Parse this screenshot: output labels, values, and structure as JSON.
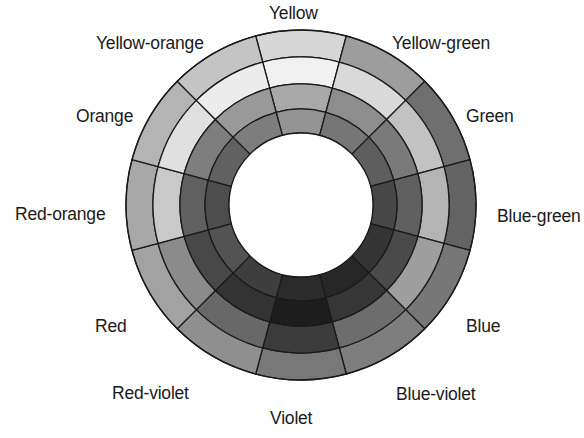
{
  "diagram": {
    "type": "color-wheel",
    "rendering": "grayscale",
    "sector_count": 12,
    "ring_count": 4,
    "geometry": {
      "center_x": 301,
      "center_y": 205,
      "outer_radius": 175,
      "ring_radii": [
        175,
        148,
        121,
        96,
        72
      ],
      "hole_radius": 72,
      "sector_degrees": 30,
      "stroke_color": "#1a1a1a",
      "stroke_width": 1.3,
      "background": "#ffffff"
    },
    "ring_names": [
      "outer-ring",
      "second-ring",
      "third-ring",
      "inner-ring"
    ],
    "hues": [
      {
        "name": "Yellow",
        "angle": 0,
        "label_x": 269,
        "label_y": 5,
        "rings": [
          "#d6d6d6",
          "#f1f1f1",
          "#a9a9a9",
          "#949494"
        ]
      },
      {
        "name": "Yellow-green",
        "angle": 30,
        "label_x": 392,
        "label_y": 35,
        "rings": [
          "#9d9d9d",
          "#d9d9d9",
          "#8d8d8d",
          "#767676"
        ]
      },
      {
        "name": "Green",
        "angle": 60,
        "label_x": 466,
        "label_y": 108,
        "rings": [
          "#6f6f6f",
          "#c2c2c2",
          "#7a7a7a",
          "#5e5e5e"
        ]
      },
      {
        "name": "Blue-green",
        "angle": 90,
        "label_x": 497,
        "label_y": 208,
        "rings": [
          "#636363",
          "#b4b4b4",
          "#5f5f5f",
          "#474747"
        ]
      },
      {
        "name": "Blue",
        "angle": 120,
        "label_x": 466,
        "label_y": 318,
        "rings": [
          "#777777",
          "#9e9e9e",
          "#4a4a4a",
          "#343434"
        ]
      },
      {
        "name": "Blue-violet",
        "angle": 150,
        "label_x": 396,
        "label_y": 386,
        "rings": [
          "#7e7e7e",
          "#6d6d6d",
          "#363636",
          "#272727"
        ]
      },
      {
        "name": "Violet",
        "angle": 180,
        "label_x": 270,
        "label_y": 410,
        "rings": [
          "#787878",
          "#3b3b3b",
          "#1d1d1d",
          "#2b2b2b"
        ]
      },
      {
        "name": "Red-violet",
        "angle": 210,
        "label_x": 112,
        "label_y": 385,
        "rings": [
          "#8f8f8f",
          "#686868",
          "#333333",
          "#3e3e3e"
        ]
      },
      {
        "name": "Red",
        "angle": 240,
        "label_x": 95,
        "label_y": 318,
        "rings": [
          "#a2a2a2",
          "#8b8b8b",
          "#484848",
          "#535353"
        ]
      },
      {
        "name": "Red-orange",
        "angle": 270,
        "label_x": 15,
        "label_y": 206,
        "rings": [
          "#a8a8a8",
          "#c9c9c9",
          "#606060",
          "#4d4d4d"
        ]
      },
      {
        "name": "Orange",
        "angle": 300,
        "label_x": 76,
        "label_y": 108,
        "rings": [
          "#b4b4b4",
          "#e0e0e0",
          "#7e7e7e",
          "#616161"
        ]
      },
      {
        "name": "Yellow-orange",
        "angle": 330,
        "label_x": 96,
        "label_y": 35,
        "rings": [
          "#c4c4c4",
          "#ececec",
          "#999999",
          "#7d7d7d"
        ]
      }
    ]
  }
}
